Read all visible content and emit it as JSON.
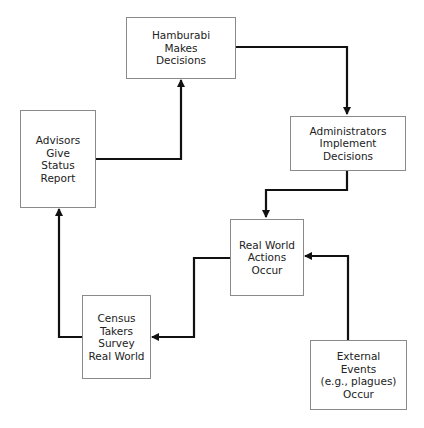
{
  "diagram": {
    "type": "flowchart",
    "nodes": [
      {
        "id": "hamburabi",
        "label": "Hamburabi\nMakes\nDecisions"
      },
      {
        "id": "administrators",
        "label": "Administrators\nImplement\nDecisions"
      },
      {
        "id": "real_world",
        "label": "Real World\nActions\nOccur"
      },
      {
        "id": "census",
        "label": "Census\nTakers\nSurvey\nReal World"
      },
      {
        "id": "advisors",
        "label": "Advisors\nGive\nStatus\nReport"
      },
      {
        "id": "external",
        "label": "External\nEvents\n(e.g., plagues)\nOccur"
      }
    ],
    "edges": [
      {
        "from": "hamburabi",
        "to": "administrators"
      },
      {
        "from": "administrators",
        "to": "real_world"
      },
      {
        "from": "real_world",
        "to": "census"
      },
      {
        "from": "census",
        "to": "advisors"
      },
      {
        "from": "advisors",
        "to": "hamburabi"
      },
      {
        "from": "external",
        "to": "real_world"
      }
    ]
  }
}
